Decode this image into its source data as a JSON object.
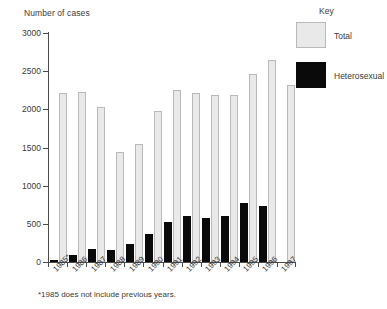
{
  "chart_data": {
    "type": "bar",
    "title": "",
    "subtitle": "",
    "xlabel": "",
    "ylabel": "Number of cases",
    "ylim": [
      0,
      3000
    ],
    "ytick_labels": [
      "0",
      "500",
      "1000",
      "1500",
      "2000",
      "2500",
      "3000"
    ],
    "ytick_values": [
      0,
      500,
      1000,
      1500,
      2000,
      2500,
      3000
    ],
    "grid": false,
    "legend_position": "top-right",
    "legend_title": "Key",
    "categories": [
      "1985*",
      "1986",
      "1987",
      "1988",
      "1989",
      "1990",
      "1991",
      "1992",
      "1993",
      "1994",
      "1995",
      "1996",
      "1997"
    ],
    "series": [
      {
        "name": "Heterosexual",
        "color": "#0a0a0a",
        "values": [
          30,
          95,
          175,
          160,
          230,
          370,
          530,
          600,
          580,
          605,
          770,
          730,
          0
        ]
      },
      {
        "name": "Total",
        "color": "#e9e9e9",
        "values": [
          2210,
          2230,
          2030,
          1440,
          1540,
          1980,
          2260,
          2210,
          2190,
          2190,
          2460,
          2650,
          2320
        ]
      }
    ],
    "annotations": [
      "*1985 does not include previous years."
    ]
  },
  "axis": {
    "y_title": "Number of cases"
  },
  "legend": {
    "title": "Key",
    "items": [
      {
        "label": "Total",
        "color": "#e9e9e9"
      },
      {
        "label": "Heterosexual",
        "color": "#0a0a0a"
      }
    ]
  },
  "footnote": {
    "text": "*1985 does not include previous years."
  }
}
